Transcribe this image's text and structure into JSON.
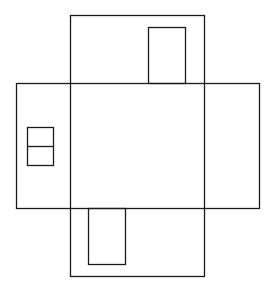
{
  "diagram": {
    "type": "floor-plan-cross",
    "stroke_color": "#1a1a1a",
    "background_color": "#ffffff",
    "shapes": [
      {
        "name": "vertical-band",
        "x": 70,
        "y": 15,
        "width": 134,
        "height": 261
      },
      {
        "name": "horizontal-band",
        "x": 16,
        "y": 83,
        "width": 243,
        "height": 125
      },
      {
        "name": "top-inner-rect",
        "x": 148,
        "y": 27,
        "width": 37,
        "height": 56
      },
      {
        "name": "bottom-inner-rect",
        "x": 88,
        "y": 208,
        "width": 37,
        "height": 56
      },
      {
        "name": "left-window-rect",
        "x": 27,
        "y": 127,
        "width": 26,
        "height": 38
      },
      {
        "name": "left-window-divider",
        "x1": 27,
        "y1": 146,
        "x2": 53,
        "y2": 146
      }
    ]
  }
}
